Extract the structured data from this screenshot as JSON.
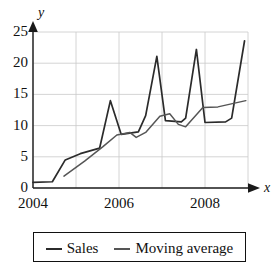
{
  "chart_data": {
    "type": "line",
    "title": "",
    "xlabel": "x",
    "ylabel": "y",
    "xlim": [
      2004,
      2009
    ],
    "ylim": [
      0,
      25
    ],
    "grid": true,
    "xticks": [
      2004,
      2006,
      2008
    ],
    "xtick_labels": [
      "2004",
      "2006",
      "2008"
    ],
    "yticks": [
      0,
      5,
      10,
      15,
      20,
      25
    ],
    "ytick_labels": [
      "0",
      "5",
      "10",
      "15",
      "20",
      "25"
    ],
    "legend_position": "below-plot",
    "series": [
      {
        "name": "Sales",
        "color": "#2b2b2b",
        "points": [
          [
            2004.0,
            0.9
          ],
          [
            2004.45,
            1.0
          ],
          [
            2004.75,
            4.5
          ],
          [
            2005.1,
            5.5
          ],
          [
            2005.55,
            6.4
          ],
          [
            2005.8,
            14.0
          ],
          [
            2006.05,
            8.6
          ],
          [
            2006.45,
            9.0
          ],
          [
            2006.62,
            11.6
          ],
          [
            2006.88,
            21.1
          ],
          [
            2007.08,
            10.8
          ],
          [
            2007.45,
            10.6
          ],
          [
            2007.55,
            11.2
          ],
          [
            2007.8,
            22.2
          ],
          [
            2008.0,
            10.5
          ],
          [
            2008.48,
            10.6
          ],
          [
            2008.62,
            11.2
          ],
          [
            2008.92,
            23.6
          ]
        ]
      },
      {
        "name": "Moving average",
        "color": "#555555",
        "points": [
          [
            2004.72,
            1.9
          ],
          [
            2005.2,
            4.3
          ],
          [
            2005.62,
            6.6
          ],
          [
            2005.95,
            8.5
          ],
          [
            2006.25,
            8.9
          ],
          [
            2006.4,
            8.1
          ],
          [
            2006.62,
            8.9
          ],
          [
            2006.95,
            11.5
          ],
          [
            2007.18,
            11.9
          ],
          [
            2007.38,
            10.2
          ],
          [
            2007.55,
            9.8
          ],
          [
            2007.95,
            12.9
          ],
          [
            2008.3,
            13.0
          ],
          [
            2008.95,
            14.0
          ]
        ]
      }
    ]
  },
  "axes": {
    "y_axis_name": "y",
    "x_axis_name": "x"
  },
  "legend": {
    "entries": [
      {
        "label": "Sales",
        "color": "#2b2b2b"
      },
      {
        "label": "Moving average",
        "color": "#555555"
      }
    ]
  }
}
